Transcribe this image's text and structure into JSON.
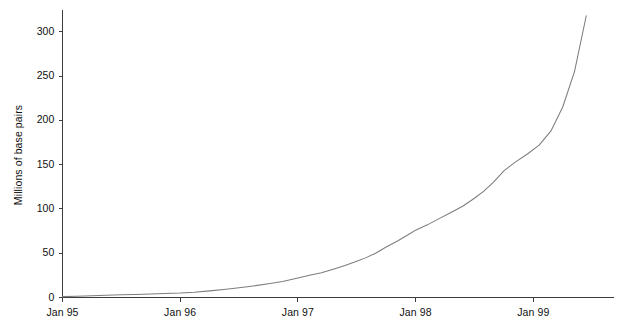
{
  "chart_data": {
    "type": "line",
    "title": "",
    "subtitle": "",
    "xlabel": "",
    "ylabel": "Millions of base pairs",
    "xlim_labels": [
      "Jan 95",
      "Jan 99"
    ],
    "ylim": [
      0,
      320
    ],
    "grid": false,
    "legend": null,
    "axis_style": "left-and-bottom spines only",
    "line_color": "#7d7d7d",
    "axis_color": "#3c3c3c",
    "background_color": "#ffffff",
    "y_ticks": [
      0,
      50,
      100,
      150,
      200,
      250,
      300
    ],
    "y_tick_labels": [
      "0",
      "50",
      "100",
      "150",
      "200",
      "250",
      "300"
    ],
    "x_ticks": [
      "Jan 95",
      "Jan 96",
      "Jan 97",
      "Jan 98",
      "Jan 99"
    ],
    "x_tick_values": [
      0,
      1,
      2,
      3,
      4
    ],
    "x_unit": "years since Jan 95",
    "series": [
      {
        "name": "GenBank cumulative base pairs",
        "x": [
          0.0,
          0.12,
          0.25,
          0.37,
          0.5,
          0.62,
          0.75,
          0.87,
          1.0,
          1.12,
          1.25,
          1.37,
          1.5,
          1.62,
          1.75,
          1.87,
          2.0,
          2.1,
          2.2,
          2.3,
          2.4,
          2.5,
          2.58,
          2.66,
          2.75,
          2.85,
          2.95,
          3.0,
          3.1,
          3.2,
          3.3,
          3.4,
          3.5,
          3.58,
          3.66,
          3.75,
          3.85,
          3.95,
          4.05,
          4.15,
          4.25,
          4.35,
          4.45
        ],
        "values": [
          1,
          1.5,
          2,
          2.5,
          3,
          3.5,
          4,
          4.5,
          5,
          6,
          7.5,
          9,
          11,
          13,
          15.5,
          18,
          22,
          25,
          28,
          32,
          36,
          41,
          45,
          50,
          57,
          64,
          72,
          76,
          82,
          89,
          96,
          103,
          112,
          120,
          130,
          143,
          153,
          162,
          172,
          188,
          215,
          255,
          318
        ],
        "marker": "none",
        "linestyle": "solid"
      }
    ],
    "annotations": []
  },
  "geometry": {
    "plot_left_px": 62,
    "plot_bottom_px": 297,
    "px_per_year": 117.7,
    "px_per_50_units": 44.3
  }
}
